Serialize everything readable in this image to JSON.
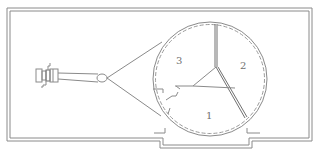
{
  "diagram": {
    "type": "technical-line-drawing",
    "colors": {
      "line": "#8a8a8a",
      "dash": "#9a9a9a",
      "label": "#707070",
      "background": "#ffffff"
    },
    "sectors": [
      {
        "id": "sector-3",
        "label": "3"
      },
      {
        "id": "sector-2",
        "label": "2"
      },
      {
        "id": "sector-1",
        "label": "1"
      }
    ]
  }
}
